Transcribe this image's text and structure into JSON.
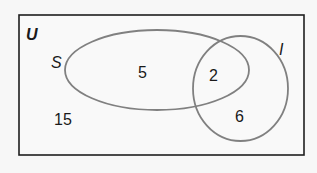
{
  "diagram": {
    "type": "venn",
    "universe": {
      "label": "U",
      "outside_count": "15"
    },
    "sets": [
      {
        "label": "S",
        "only_count": "5"
      },
      {
        "label": "I",
        "only_count": "6"
      }
    ],
    "intersection_count": "2",
    "colors": {
      "background": "#f7f7f7",
      "border": "#1e1e1e",
      "set_outline": "#808080",
      "text": "#1a1a1a"
    }
  }
}
